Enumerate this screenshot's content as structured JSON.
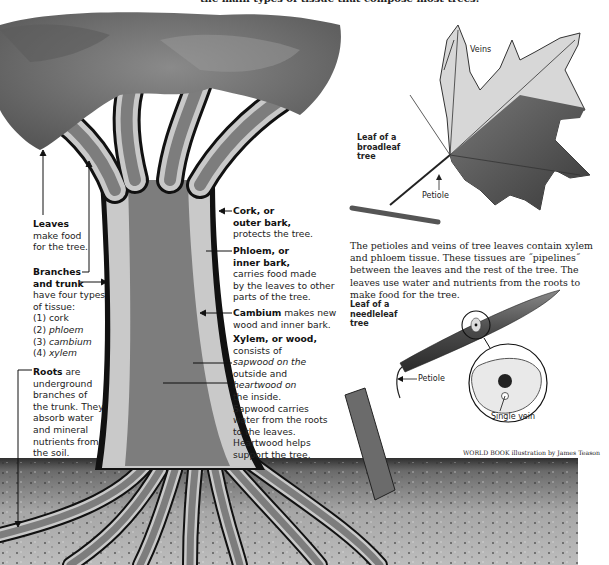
{
  "caption_top": "the main types of tissue that compose most trees.",
  "tree_labels": {
    "leaves": {
      "title": "Leaves",
      "text": [
        "make food",
        "for the tree."
      ]
    },
    "branches": {
      "title_lines": [
        "Branches",
        "and trunk"
      ],
      "text": [
        "have four types",
        "of tissue:"
      ],
      "list": [
        {
          "num": "(1)",
          "item": "cork"
        },
        {
          "num": "(2)",
          "item": "phloem"
        },
        {
          "num": "(3)",
          "item": "cambium"
        },
        {
          "num": "(4)",
          "item": "xylem"
        }
      ]
    },
    "roots": {
      "title": "Roots",
      "title_suffix": " are",
      "text": [
        "underground",
        "branches of",
        "the trunk. They",
        "absorb water",
        "and mineral",
        "nutrients from",
        "the soil."
      ]
    },
    "cork": {
      "title_lines": [
        "Cork, or",
        "outer bark,"
      ],
      "text": [
        "protects the tree."
      ]
    },
    "phloem": {
      "title_lines": [
        "Phloem, or",
        "inner bark,"
      ],
      "text": [
        "carries food made",
        "by the leaves to other",
        "parts of the tree."
      ]
    },
    "cambium": {
      "title": "Cambium",
      "text_first": " makes new",
      "text": [
        "wood and inner bark."
      ]
    },
    "xylem": {
      "title": "Xylem, or wood,",
      "lines": [
        "consists of",
        "sapwood on the",
        "outside and",
        "heartwood on",
        "the inside.",
        "Sapwood carries",
        "water from the roots",
        "to the leaves.",
        "Heartwood helps",
        "support the tree."
      ]
    }
  },
  "broadleaf": {
    "title_lines": [
      "Leaf of a",
      "broadleaf",
      "tree"
    ],
    "veins_label": "Veins",
    "petiole_label": "Petiole"
  },
  "description": "The petioles and veins of tree leaves contain xylem and phloem tissue. These tissues are ˝pipelines˝ between the leaves and the rest of the tree. The leaves use water and nutrients from the roots to make food for the tree.",
  "needleleaf": {
    "title_lines": [
      "Leaf of a",
      "needleleaf",
      "tree"
    ],
    "petiole_label": "Petiole",
    "vein_label": "Single vein"
  },
  "credit": "WORLD BOOK illustration by James Teason",
  "colors": {
    "canopy": "#6f6f6f",
    "bark_dark": "#111111",
    "phloem_light": "#c9c9c9",
    "xylem_mid": "#7d7d7d",
    "soil": "#9a9a9a",
    "soil_dark": "#3a3a3a"
  }
}
